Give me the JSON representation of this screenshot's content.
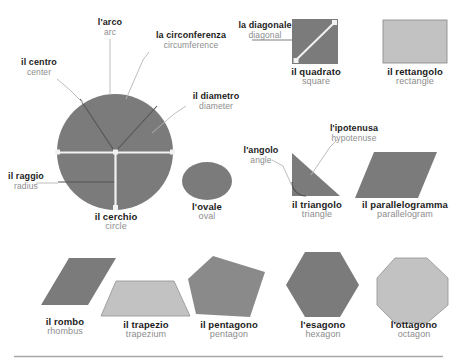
{
  "page": {
    "background_color": "#ffffff",
    "colors": {
      "shape_dark": "#7b7b7b",
      "shape_light": "#c2c2c2",
      "shape_mid": "#8a8a8a",
      "outline": "#6f6f6f",
      "leader_line": "#b5b5b5",
      "label_italian": "#1c1c1c",
      "label_english": "#8d8d8d",
      "accent_white": "#f2f2f2",
      "divider": "#a8a8a8"
    }
  },
  "figures": [
    {
      "id": "circle",
      "shape": "circle",
      "italian": "il cerchio",
      "english": "circle",
      "fill": "#7b7b7b",
      "label_position": "below"
    },
    {
      "id": "square",
      "shape": "square",
      "italian": "il quadrato",
      "english": "square",
      "fill": "#7b7b7b",
      "label_position": "below"
    },
    {
      "id": "rectangle",
      "shape": "rectangle",
      "italian": "il rettangolo",
      "english": "rectangle",
      "fill": "#c2c2c2",
      "label_position": "below"
    },
    {
      "id": "oval",
      "shape": "ellipse",
      "italian": "l'ovale",
      "english": "oval",
      "fill": "#7b7b7b",
      "label_position": "below"
    },
    {
      "id": "triangle",
      "shape": "right-triangle",
      "italian": "il triangolo",
      "english": "triangle",
      "fill": "#7b7b7b",
      "label_position": "below"
    },
    {
      "id": "parallelogram",
      "shape": "parallelogram",
      "italian": "il parallelogramma",
      "english": "parallelogram",
      "fill": "#7b7b7b",
      "label_position": "below"
    },
    {
      "id": "rhombus",
      "shape": "rhombus",
      "italian": "il rombo",
      "english": "rhombus",
      "fill": "#7b7b7b",
      "label_position": "below"
    },
    {
      "id": "trapezium",
      "shape": "trapezium",
      "italian": "il trapezio",
      "english": "trapezium",
      "fill": "#c2c2c2",
      "label_position": "below"
    },
    {
      "id": "pentagon",
      "shape": "pentagon",
      "italian": "il pentagono",
      "english": "pentagon",
      "fill": "#8a8a8a",
      "label_position": "below"
    },
    {
      "id": "hexagon",
      "shape": "hexagon",
      "italian": "l'esagono",
      "english": "hexagon",
      "fill": "#7b7b7b",
      "label_position": "below"
    },
    {
      "id": "octagon",
      "shape": "ottagono",
      "italian": "l'ottagono",
      "english": "octagon",
      "fill": "#c2c2c2",
      "label_position": "below"
    }
  ],
  "callouts": [
    {
      "id": "arc",
      "italian": "l'arco",
      "english": "arc",
      "target": "circle"
    },
    {
      "id": "circumference",
      "italian": "la circonferenza",
      "english": "circumference",
      "target": "circle"
    },
    {
      "id": "center",
      "italian": "il centro",
      "english": "center",
      "target": "circle"
    },
    {
      "id": "diameter",
      "italian": "il diametro",
      "english": "diameter",
      "target": "circle"
    },
    {
      "id": "radius",
      "italian": "il raggio",
      "english": "radius",
      "target": "circle"
    },
    {
      "id": "diagonal",
      "italian": "la diagonale",
      "english": "diagonal",
      "target": "square"
    },
    {
      "id": "angle",
      "italian": "l'angolo",
      "english": "angle",
      "target": "triangle"
    },
    {
      "id": "hypotenuse",
      "italian": "l'ipotenusa",
      "english": "hypotenuse",
      "target": "triangle"
    }
  ]
}
